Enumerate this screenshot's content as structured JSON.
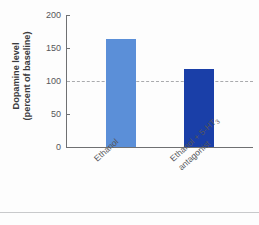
{
  "chart_data": {
    "type": "bar",
    "title": "",
    "xlabel": "",
    "ylabel_line1": "Dopamine level",
    "ylabel_line2": "(percent of baseline)",
    "categories": [
      "Ethanol",
      "Ethanol + 5-HT3 antagonist"
    ],
    "values": [
      163,
      118
    ],
    "ylim": [
      0,
      200
    ],
    "yticks": [
      0,
      50,
      100,
      150,
      200
    ],
    "ytick_labels": [
      "0",
      "50",
      "100",
      "150",
      "200"
    ],
    "grid": false,
    "legend": "none",
    "reference_line": {
      "value": 100,
      "style": "dashed",
      "color": "#a9aaad",
      "label": ""
    },
    "bars": [
      {
        "label_text": "Ethanol",
        "label_line1": "Ethanol",
        "label_line2": "",
        "value": 163,
        "color": "#5b8fd8"
      },
      {
        "label_text": "Ethanol + 5-HT3 antagonist",
        "label_line1": "Ethanol + 5-HT",
        "label_sub": "3",
        "label_line2": "antagonist",
        "value": 118,
        "color": "#1a3fa8"
      }
    ]
  },
  "colors": {
    "bar_light": "#5b8fd8",
    "bar_dark": "#1a3fa8",
    "axis": "#6f7072",
    "text": "#55565a",
    "title_text": "#3b3b3d",
    "refline": "#a9aaad",
    "background": "#fdfdfd"
  }
}
